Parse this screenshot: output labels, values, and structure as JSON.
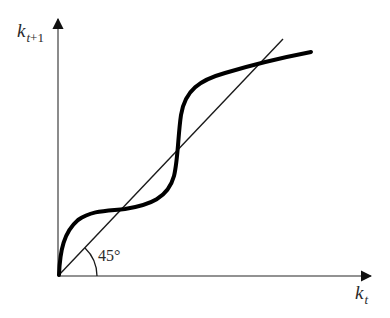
{
  "diagram": {
    "type": "phase-diagram",
    "axes": {
      "y": {
        "label_main": "k",
        "label_sub_var": "t",
        "label_sub_rest": "+1"
      },
      "x": {
        "label_main": "k",
        "label_sub_var": "t",
        "label_sub_rest": ""
      }
    },
    "reference_line": {
      "name": "45-degree line",
      "angle_label": "45°"
    },
    "curve": {
      "name": "law of motion k_{t+1} = f(k_t)",
      "shape": "S-shaped, intersects 45° line three times"
    },
    "intersections_count": 3,
    "colors": {
      "axis": "#6e6e6e",
      "curve": "#000000",
      "line": "#1a1a1a",
      "text": "#2b2b2b"
    }
  }
}
